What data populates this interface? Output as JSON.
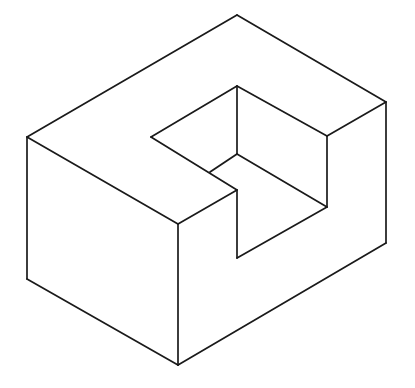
{
  "diagram": {
    "type": "isometric-solid",
    "stroke_color": "#1a1a1a",
    "background": "#ffffff",
    "stroke_width": 1.7,
    "edges": [
      {
        "id": "top-back-right",
        "x1": 237,
        "y1": 15,
        "x2": 386,
        "y2": 102
      },
      {
        "id": "top-back-left",
        "x1": 237,
        "y1": 15,
        "x2": 27,
        "y2": 137
      },
      {
        "id": "top-front-left",
        "x1": 27,
        "y1": 137,
        "x2": 178,
        "y2": 224
      },
      {
        "id": "top-front-step",
        "x1": 178,
        "y1": 224,
        "x2": 237,
        "y2": 190
      },
      {
        "id": "top-right-step",
        "x1": 386,
        "y1": 102,
        "x2": 327,
        "y2": 136
      },
      {
        "id": "left-vertical",
        "x1": 27,
        "y1": 137,
        "x2": 27,
        "y2": 279
      },
      {
        "id": "front-vertical",
        "x1": 178,
        "y1": 224,
        "x2": 178,
        "y2": 365
      },
      {
        "id": "right-vertical",
        "x1": 386,
        "y1": 102,
        "x2": 386,
        "y2": 243
      },
      {
        "id": "bottom-left",
        "x1": 27,
        "y1": 279,
        "x2": 178,
        "y2": 365
      },
      {
        "id": "bottom-right",
        "x1": 178,
        "y1": 365,
        "x2": 386,
        "y2": 243
      },
      {
        "id": "notch-top-left",
        "x1": 151,
        "y1": 137,
        "x2": 237,
        "y2": 86
      },
      {
        "id": "notch-top-right",
        "x1": 237,
        "y1": 86,
        "x2": 327,
        "y2": 136
      },
      {
        "id": "notch-right-vertical",
        "x1": 327,
        "y1": 136,
        "x2": 327,
        "y2": 207
      },
      {
        "id": "notch-floor-front",
        "x1": 327,
        "y1": 207,
        "x2": 237,
        "y2": 258
      },
      {
        "id": "notch-front-vertical",
        "x1": 237,
        "y1": 258,
        "x2": 237,
        "y2": 190
      },
      {
        "id": "notch-left-diagonal",
        "x1": 151,
        "y1": 137,
        "x2": 237,
        "y2": 190
      },
      {
        "id": "notch-back-vertical",
        "x1": 237,
        "y1": 86,
        "x2": 237,
        "y2": 154
      },
      {
        "id": "notch-floor-left",
        "x1": 237,
        "y1": 154,
        "x2": 210,
        "y2": 172
      },
      {
        "id": "notch-floor-right",
        "x1": 237,
        "y1": 154,
        "x2": 327,
        "y2": 207
      }
    ]
  }
}
